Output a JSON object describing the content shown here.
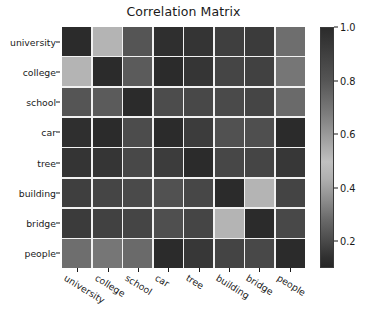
{
  "figure": {
    "title": "Correlation Matrix",
    "background": "#ffffff",
    "text_color": "#1a1a1a",
    "grid_line_color": "#f2f2f2"
  },
  "colorbar": {
    "ticks": [
      "1.0",
      "0.8",
      "0.6",
      "0.4",
      "0.2"
    ],
    "tick_values": [
      1.0,
      0.8,
      0.6,
      0.4,
      0.2
    ],
    "vmin": 0.1,
    "vmax": 1.0,
    "style": "grayscale, non-monotonic: dark at 1.0, lightest near 0.5, darkening again toward 0.1"
  },
  "chart_data": {
    "type": "heatmap",
    "title": "Correlation Matrix",
    "xlabel": "",
    "ylabel": "",
    "grid": true,
    "legend": "colorbar-right",
    "categories": [
      "university",
      "college",
      "school",
      "car",
      "tree",
      "building",
      "bridge",
      "people"
    ],
    "x": [
      "university",
      "college",
      "school",
      "car",
      "tree",
      "building",
      "bridge",
      "people"
    ],
    "y": [
      "university",
      "college",
      "school",
      "car",
      "tree",
      "building",
      "bridge",
      "people"
    ],
    "zlim": [
      0.1,
      1.0
    ],
    "values": [
      [
        1.0,
        0.55,
        0.3,
        0.18,
        0.16,
        0.2,
        0.19,
        0.38
      ],
      [
        0.55,
        1.0,
        0.32,
        0.15,
        0.17,
        0.22,
        0.21,
        0.4
      ],
      [
        0.3,
        0.32,
        1.0,
        0.26,
        0.24,
        0.25,
        0.23,
        0.36
      ],
      [
        0.18,
        0.15,
        0.26,
        1.0,
        0.2,
        0.28,
        0.27,
        0.15
      ],
      [
        0.16,
        0.17,
        0.24,
        0.2,
        1.0,
        0.24,
        0.23,
        0.18
      ],
      [
        0.2,
        0.22,
        0.25,
        0.28,
        0.24,
        1.0,
        0.55,
        0.22
      ],
      [
        0.19,
        0.21,
        0.23,
        0.27,
        0.23,
        0.55,
        1.0,
        0.24
      ],
      [
        0.38,
        0.4,
        0.36,
        0.15,
        0.18,
        0.22,
        0.24,
        1.0
      ]
    ],
    "cell_colors": [
      [
        "#2b2b2b",
        "#b4b4b4",
        "#555555",
        "#2f2f2f",
        "#343434",
        "#3f3f3f",
        "#3b3b3b",
        "#6e6e6e"
      ],
      [
        "#b4b4b4",
        "#2b2b2b",
        "#5b5b5b",
        "#2b2b2b",
        "#353535",
        "#454545",
        "#414141",
        "#767676"
      ],
      [
        "#555555",
        "#5b5b5b",
        "#2b2b2b",
        "#4c4c4c",
        "#484848",
        "#4a4a4a",
        "#454545",
        "#6a6a6a"
      ],
      [
        "#2f2f2f",
        "#2b2b2b",
        "#4c4c4c",
        "#2b2b2b",
        "#3c3c3c",
        "#515151",
        "#4f4f4f",
        "#2b2b2b"
      ],
      [
        "#343434",
        "#353535",
        "#484848",
        "#3c3c3c",
        "#2b2b2b",
        "#474747",
        "#454545",
        "#373737"
      ],
      [
        "#3f3f3f",
        "#454545",
        "#4a4a4a",
        "#515151",
        "#474747",
        "#2b2b2b",
        "#b4b4b4",
        "#444444"
      ],
      [
        "#3b3b3b",
        "#414141",
        "#454545",
        "#4f4f4f",
        "#454545",
        "#b4b4b4",
        "#2b2b2b",
        "#484848"
      ],
      [
        "#6e6e6e",
        "#767676",
        "#6a6a6a",
        "#2b2b2b",
        "#373737",
        "#444444",
        "#484848",
        "#2b2b2b"
      ]
    ]
  }
}
